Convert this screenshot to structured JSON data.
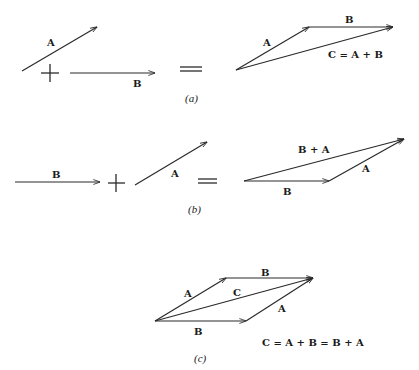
{
  "figure": {
    "colors": {
      "ink": "#2a2a2a",
      "background": "#ffffff"
    },
    "panels": [
      {
        "id": "a",
        "caption": "(a)",
        "operands": [
          {
            "label": "A",
            "from": [
              22,
              71
            ],
            "to": [
              97,
              27
            ]
          },
          {
            "label": "B",
            "from": [
              70,
              73
            ],
            "to": [
              155,
              73
            ]
          }
        ],
        "operator": "+",
        "equals": "=",
        "result": {
          "vectors": [
            {
              "label": "A",
              "from": [
                236,
                70
              ],
              "to": [
                309,
                27
              ]
            },
            {
              "label": "B",
              "from": [
                309,
                27
              ],
              "to": [
                393,
                27
              ]
            },
            {
              "label": "C = A + B",
              "from": [
                236,
                70
              ],
              "to": [
                393,
                27
              ]
            }
          ]
        }
      },
      {
        "id": "b",
        "caption": "(b)",
        "operands": [
          {
            "label": "B",
            "from": [
              15,
              182
            ],
            "to": [
              100,
              182
            ]
          },
          {
            "label": "A",
            "from": [
              135,
              185
            ],
            "to": [
              207,
              142
            ]
          }
        ],
        "operator": "+",
        "equals": "=",
        "result": {
          "vectors": [
            {
              "label": "B",
              "from": [
                244,
                181
              ],
              "to": [
                329,
                181
              ]
            },
            {
              "label": "A",
              "from": [
                329,
                181
              ],
              "to": [
                404,
                139
              ]
            },
            {
              "label": "B + A",
              "from": [
                244,
                181
              ],
              "to": [
                404,
                139
              ]
            }
          ]
        }
      },
      {
        "id": "c",
        "caption": "(c)",
        "vectors": [
          {
            "label": "A",
            "from": [
              155,
              321
            ],
            "to": [
              226,
              278
            ]
          },
          {
            "label": "B",
            "from": [
              226,
              278
            ],
            "to": [
              313,
              278
            ]
          },
          {
            "label": "C",
            "from": [
              155,
              321
            ],
            "to": [
              313,
              278
            ]
          },
          {
            "label": "B",
            "from": [
              155,
              321
            ],
            "to": [
              246,
              321
            ]
          },
          {
            "label": "A",
            "from": [
              246,
              321
            ],
            "to": [
              313,
              278
            ]
          }
        ],
        "equation": "C = A + B = B + A"
      }
    ]
  },
  "labels": {
    "a": {
      "op_A": "A",
      "op_B": "B",
      "res_A": "A",
      "res_B": "B",
      "res_C": "C = A + B",
      "caption": "(a)"
    },
    "b": {
      "op_B": "B",
      "op_A": "A",
      "res_BA": "B + A",
      "res_A": "A",
      "res_B": "B",
      "caption": "(b)"
    },
    "c": {
      "top_A": "A",
      "top_B": "B",
      "diag_C": "C",
      "bot_A": "A",
      "bot_B": "B",
      "equation": "C = A + B = B + A",
      "caption": "(c)"
    }
  }
}
